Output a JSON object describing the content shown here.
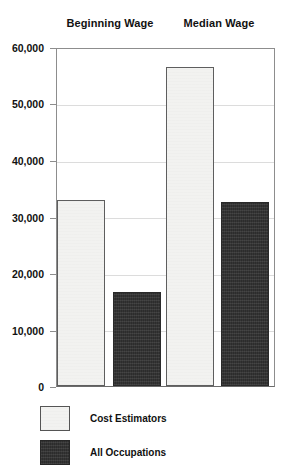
{
  "chart_data": {
    "type": "bar",
    "title": "",
    "xlabel": "",
    "ylabel": "",
    "categories": [
      "Beginning Wage",
      "Median Wage"
    ],
    "series": [
      {
        "name": "Cost Estimators",
        "values": [
          33000,
          56500
        ],
        "color": "#f2f2f0"
      },
      {
        "name": "All Occupations",
        "values": [
          16600,
          32500
        ],
        "color": "#343434"
      }
    ],
    "ylim": [
      0,
      60000
    ],
    "yticks": [
      0,
      10000,
      20000,
      30000,
      40000,
      50000,
      60000
    ],
    "ytick_labels": [
      "0",
      "10,000",
      "20,000",
      "30,000",
      "40,000",
      "50,000",
      "60,000"
    ],
    "grid": true,
    "legend_position": "bottom-left",
    "bars": [
      {
        "group": "Beginning Wage",
        "series": "Cost Estimators",
        "value": 33000,
        "style": "light"
      },
      {
        "group": "Beginning Wage",
        "series": "All Occupations",
        "value": 16600,
        "style": "dark"
      },
      {
        "group": "Median Wage",
        "series": "Cost Estimators",
        "value": 56500,
        "style": "light"
      },
      {
        "group": "Median Wage",
        "series": "All Occupations",
        "value": 32500,
        "style": "dark"
      }
    ]
  },
  "headers": {
    "group_0": "Beginning Wage",
    "group_1": "Median Wage"
  },
  "axis": {
    "tick_0": "0",
    "tick_1": "10,000",
    "tick_2": "20,000",
    "tick_3": "30,000",
    "tick_4": "40,000",
    "tick_5": "50,000",
    "tick_6": "60,000"
  },
  "legend": {
    "item_0": "Cost Estimators",
    "item_1": "All Occupations"
  },
  "colors": {
    "light_fill": "#f2f2f0",
    "dark_fill": "#343434",
    "gridline": "#dcdcdc",
    "frame": "#8d8d8d",
    "text": "#111111"
  }
}
